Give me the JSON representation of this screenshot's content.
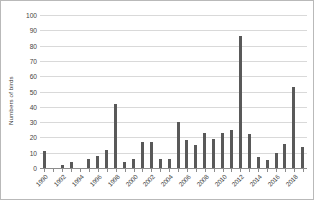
{
  "chart_data": {
    "type": "bar",
    "title": "",
    "xlabel": "",
    "ylabel": "Numbers of birds",
    "ylim": [
      0,
      100
    ],
    "ytick_step": 10,
    "yticks": [
      0,
      10,
      20,
      30,
      40,
      50,
      60,
      70,
      80,
      90,
      100
    ],
    "grid": true,
    "legend": "none",
    "bar_color": "#595959",
    "gridline_color": "#d9d9d9",
    "axis_color": "#8c8c8c",
    "xtick_labels": [
      "1990",
      "1992",
      "1994",
      "1996",
      "1998",
      "2000",
      "2002",
      "2004",
      "2006",
      "2008",
      "2010",
      "2012",
      "2014",
      "2016",
      "2018"
    ],
    "xtick_interval_years": 2,
    "categories": [
      "1990",
      "1991",
      "1992",
      "1993",
      "1994",
      "1995",
      "1996",
      "1997",
      "1998",
      "1999",
      "2000",
      "2001",
      "2002",
      "2003",
      "2004",
      "2005",
      "2006",
      "2007",
      "2008",
      "2009",
      "2010",
      "2011",
      "2012",
      "2013",
      "2014",
      "2015",
      "2016",
      "2017",
      "2018",
      "2019"
    ],
    "values": [
      11,
      0,
      2,
      4,
      0,
      6,
      8,
      12,
      42,
      4,
      6,
      17,
      17,
      6,
      6,
      30,
      18,
      15,
      23,
      19,
      23,
      25,
      86,
      22,
      7,
      5,
      10,
      16,
      53,
      14
    ],
    "values_tail_note": ""
  },
  "axis": {
    "y_title": "Numbers of birds"
  }
}
